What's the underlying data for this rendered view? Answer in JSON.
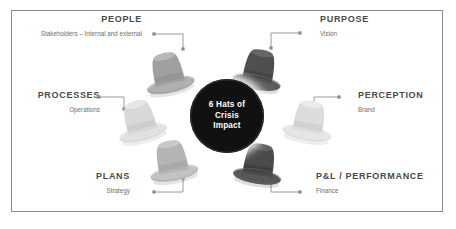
{
  "diagram": {
    "center": {
      "line1": "6 Hats of",
      "line2": "Crisis",
      "line3": "Impact",
      "background_color": "#111111",
      "text_color": "#ffffff"
    },
    "frame": {
      "border_color": "#8c8c8c",
      "background_color": "#ffffff"
    },
    "nodes": [
      {
        "id": "people",
        "title": "PEOPLE",
        "subtitle": "Stakeholders – Internal and external",
        "align": "right",
        "hat_color": "#a0a0a0",
        "hat_icon": "top-hat-icon"
      },
      {
        "id": "purpose",
        "title": "PURPOSE",
        "subtitle": "Vision",
        "align": "left",
        "hat_color": "#4f4f4f",
        "hat_icon": "top-hat-icon"
      },
      {
        "id": "processes",
        "title": "PROCESSES",
        "subtitle": "Operations",
        "align": "right",
        "hat_color": "#d8d8d8",
        "hat_icon": "top-hat-icon"
      },
      {
        "id": "perception",
        "title": "PERCEPTION",
        "subtitle": "Brand",
        "align": "left",
        "hat_color": "#dcdcdc",
        "hat_icon": "top-hat-icon"
      },
      {
        "id": "plans",
        "title": "PLANS",
        "subtitle": "Strategy",
        "align": "right",
        "hat_color": "#b4b4b4",
        "hat_icon": "top-hat-icon"
      },
      {
        "id": "pl_performance",
        "title": "P&L / PERFORMANCE",
        "subtitle": "Finance",
        "align": "left",
        "hat_color": "#4a4a4a",
        "hat_icon": "top-hat-icon"
      }
    ],
    "connector": {
      "line_color": "#9a9a9a",
      "dot_color": "#8a8a8a",
      "icon": "elbow-connector-icon"
    },
    "text_colors": {
      "title": "#4a4a4a",
      "subtitle": "#6e6e6e"
    }
  }
}
